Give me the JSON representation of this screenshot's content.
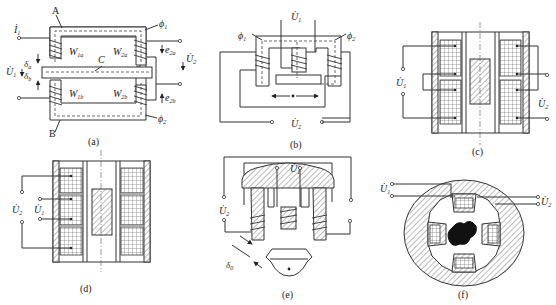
{
  "figure": {
    "panels": [
      {
        "id": "a",
        "caption": "(a)",
        "labels": {
          "core_top": "A",
          "core_bottom": "B",
          "armature": "C",
          "current": "İ",
          "current_sub": "1",
          "input_voltage": "U̇",
          "input_voltage_sub": "1",
          "output_voltage": "U̇",
          "output_voltage_sub": "2",
          "gap_a": "δ",
          "gap_a_sub": "a",
          "gap_b": "δ",
          "gap_b_sub": "b",
          "coil_1a": "W",
          "coil_1a_sub": "1a",
          "coil_2a": "W",
          "coil_2a_sub": "2a",
          "coil_1b": "W",
          "coil_1b_sub": "1b",
          "coil_2b": "W",
          "coil_2b_sub": "2b",
          "flux_1": "ϕ",
          "flux_1_sub": "1",
          "flux_2": "ϕ",
          "flux_2_sub": "2",
          "emf_2a": "e",
          "emf_2a_sub": "2a",
          "emf_2b": "e",
          "emf_2b_sub": "2b"
        }
      },
      {
        "id": "b",
        "caption": "(b)",
        "labels": {
          "input_voltage": "U̇",
          "input_voltage_sub": "1",
          "output_voltage": "U̇",
          "output_voltage_sub": "2",
          "flux_1": "ϕ",
          "flux_1_sub": "1",
          "flux_2": "ϕ",
          "flux_2_sub": "2"
        }
      },
      {
        "id": "c",
        "caption": "(c)",
        "labels": {
          "input_voltage": "U̇",
          "input_voltage_sub": "1",
          "output_voltage": "U̇",
          "output_voltage_sub": "2"
        }
      },
      {
        "id": "d",
        "caption": "(d)",
        "labels": {
          "input_voltage": "U̇",
          "input_voltage_sub": "1",
          "output_voltage": "U̇",
          "output_voltage_sub": "2"
        }
      },
      {
        "id": "e",
        "caption": "(e)",
        "labels": {
          "input_voltage": "U̇",
          "input_voltage_sub": "1",
          "output_voltage": "U̇",
          "output_voltage_sub": "2",
          "gap": "δ",
          "gap_sub": "0"
        }
      },
      {
        "id": "f",
        "caption": "(f)",
        "labels": {
          "input_voltage": "U̇",
          "input_voltage_sub": "1",
          "output_voltage": "U̇",
          "output_voltage_sub": "2"
        }
      }
    ]
  }
}
